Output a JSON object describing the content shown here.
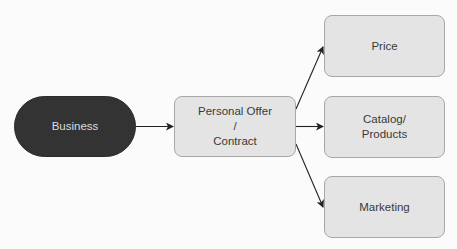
{
  "diagram": {
    "type": "flowchart",
    "nodes": {
      "business": {
        "label": "Business",
        "shape": "rounded-pill",
        "fill": "#333333",
        "text_color": "#dcdcdc"
      },
      "offer": {
        "label": "Personal Offer\n/\nContract",
        "shape": "rounded-rect",
        "fill": "#e4e4e4"
      },
      "price": {
        "label": "Price",
        "shape": "rounded-rect",
        "fill": "#e4e4e4"
      },
      "catalog": {
        "label": "Catalog/\nProducts",
        "shape": "rounded-rect",
        "fill": "#e4e4e4"
      },
      "marketing": {
        "label": "Marketing",
        "shape": "rounded-rect",
        "fill": "#e4e4e4"
      }
    },
    "edges": [
      {
        "from": "Business",
        "to": "Personal Offer / Contract"
      },
      {
        "from": "Personal Offer / Contract",
        "to": "Price"
      },
      {
        "from": "Personal Offer / Contract",
        "to": "Catalog/ Products"
      },
      {
        "from": "Personal Offer / Contract",
        "to": "Marketing"
      }
    ],
    "colors": {
      "edge": "#222222",
      "box_border": "#a8a8a8",
      "background": "#fbfbfb"
    }
  }
}
